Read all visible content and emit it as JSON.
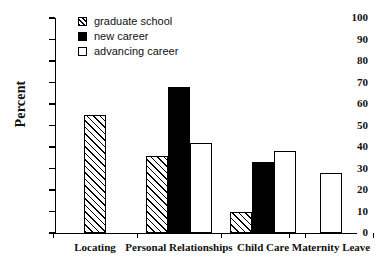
{
  "chart_data": {
    "type": "bar",
    "title": "",
    "xlabel": "",
    "ylabel": "Percent",
    "ylim": [
      0,
      100
    ],
    "ytick_step": 10,
    "yticks": [
      "100",
      "90",
      "80",
      "70",
      "60",
      "50",
      "40",
      "30",
      "20",
      "10",
      "0"
    ],
    "grid": false,
    "legend_position": "top-center",
    "categories": [
      "Locating",
      "Personal Relationships",
      "Child Care",
      "Maternity Leave"
    ],
    "series": [
      {
        "name": "graduate school",
        "marker": "hatched",
        "values": [
          55,
          36,
          10,
          null
        ]
      },
      {
        "name": "new career",
        "marker": "solid-black",
        "values": [
          null,
          68,
          33,
          null
        ]
      },
      {
        "name": "advancing career",
        "marker": "open-white",
        "values": [
          null,
          42,
          38,
          28
        ]
      }
    ]
  },
  "axes": {
    "y_title": "Percent",
    "y_tick_labels": [
      "100",
      "90",
      "80",
      "70",
      "60",
      "50",
      "40",
      "30",
      "20",
      "10",
      "0"
    ],
    "x_tick_labels": [
      "Locating",
      "Personal Relationships",
      "Child Care",
      "Maternity Leave"
    ]
  },
  "legend": {
    "items": [
      {
        "label": "graduate school",
        "marker": "hatched"
      },
      {
        "label": "new career",
        "marker": "solid-black"
      },
      {
        "label": "advancing career",
        "marker": "open-white"
      }
    ]
  },
  "colors": {
    "ink": "#000000",
    "background": "#ffffff"
  }
}
